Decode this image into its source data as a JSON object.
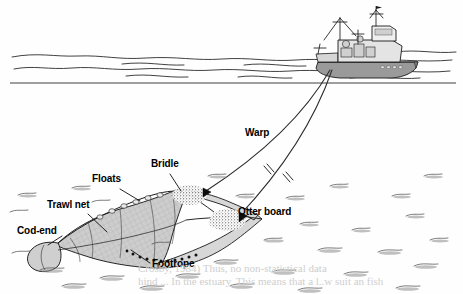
{
  "figure": {
    "style": "black-and-white line drawing, scanned book figure"
  },
  "labels": [
    {
      "name": "bridle",
      "text": "Bridle",
      "x": 151,
      "y": 164,
      "size": 10
    },
    {
      "name": "floats",
      "text": "Floats",
      "x": 92,
      "y": 179,
      "size": 10
    },
    {
      "name": "trawl-net",
      "text": "Trawl net",
      "x": 47,
      "y": 205,
      "size": 10
    },
    {
      "name": "cod-end",
      "text": "Cod-end",
      "x": 17,
      "y": 231,
      "size": 10
    },
    {
      "name": "footrope",
      "text": "Footrope",
      "x": 152,
      "y": 264,
      "size": 10
    },
    {
      "name": "warp",
      "text": "Warp",
      "x": 245,
      "y": 133,
      "size": 10
    },
    {
      "name": "otter-board",
      "text": "Otter board",
      "x": 238,
      "y": 212,
      "size": 10
    }
  ],
  "scene": {
    "vessel": "fishing trawler at sea surface",
    "water_surface_y": 83,
    "seabed_label": "stippled sea floor",
    "warp_count": 2,
    "otter_board_count": 2,
    "sediment_clouds": 2,
    "break_marks": 2
  },
  "bleed_text": [
    {
      "text": "Crosby, 1984)   Thus, no non-statistical data",
      "x": 138,
      "y": 268
    },
    {
      "text": "hind ... In the estuary, This means that a l..w suit an fish",
      "x": 138,
      "y": 281
    }
  ],
  "colors": {
    "ink": "#1a1a1a",
    "net_fill": "#c9c9c9",
    "hull_fill": "#8d8d8d",
    "paper": "#fefefe",
    "bleed": "#cfcfcf"
  }
}
